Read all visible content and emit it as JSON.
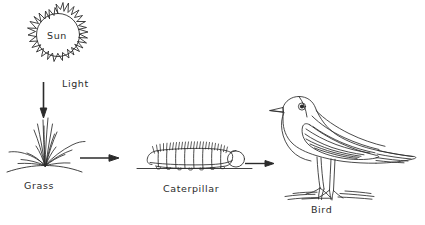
{
  "diagram": {
    "title_visible": false,
    "background_color": "#ffffff",
    "ink_color": "#2b2b2b",
    "type": "food-chain",
    "nodes": [
      {
        "id": "sun",
        "label": "Sun",
        "icon": "sun-icon",
        "x": 58,
        "y": 35
      },
      {
        "id": "grass",
        "label": "Grass",
        "icon": "grass-icon",
        "x": 45,
        "y": 145
      },
      {
        "id": "caterpillar",
        "label": "Caterpillar",
        "icon": "caterpillar-icon",
        "x": 194,
        "y": 157
      },
      {
        "id": "bird",
        "label": "Bird",
        "icon": "bird-icon",
        "x": 330,
        "y": 150
      }
    ],
    "edges": [
      {
        "id": "sun-to-grass",
        "label": "Light",
        "from": "sun",
        "to": "grass",
        "direction": "down"
      },
      {
        "id": "grass-to-caterpillar",
        "label": "",
        "from": "grass",
        "to": "caterpillar",
        "direction": "right"
      },
      {
        "id": "caterpillar-to-bird",
        "label": "",
        "from": "caterpillar",
        "to": "bird",
        "direction": "right"
      }
    ]
  },
  "labels": {
    "sun": "Sun",
    "light": "Light",
    "grass": "Grass",
    "caterpillar": "Caterpillar",
    "bird": "Bird"
  }
}
